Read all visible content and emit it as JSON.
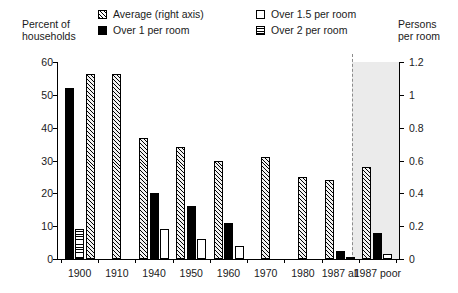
{
  "axis_captions": {
    "left_line1": "Percent of",
    "left_line2": "households",
    "right_line1": "Persons",
    "right_line2": "per room"
  },
  "legend": {
    "items": [
      {
        "label": "Average (right axis)",
        "icon": "hatch-swatch",
        "swatch": "hatch",
        "col": 1,
        "row": 1
      },
      {
        "label": "Over 1 per room",
        "icon": "solid-swatch",
        "swatch": "solid",
        "col": 1,
        "row": 2
      },
      {
        "label": "Over 1.5 per room",
        "icon": "white-swatch",
        "swatch": "white",
        "col": 2,
        "row": 1
      },
      {
        "label": "Over 2 per room",
        "icon": "hlines-swatch",
        "swatch": "hlines",
        "col": 2,
        "row": 2
      }
    ]
  },
  "chart_data": {
    "type": "bar",
    "title": "",
    "xlabel": "",
    "ylabel": "Percent of households",
    "y2label": "Persons per room",
    "ylim": [
      0,
      60
    ],
    "y2lim": [
      0,
      1.2
    ],
    "yticks": [
      "0",
      "10",
      "20",
      "30",
      "40",
      "50",
      "60"
    ],
    "ytick_values": [
      0,
      10,
      20,
      30,
      40,
      50,
      60
    ],
    "y2ticks": [
      "0",
      "0.2",
      "0.4",
      "0.6",
      "0.8",
      "1",
      "1.2"
    ],
    "y2tick_values": [
      0,
      0.2,
      0.4,
      0.6,
      0.8,
      1.0,
      1.2
    ],
    "grid": false,
    "legend_position": "top",
    "categories": [
      "1900",
      "1910",
      "1940",
      "1950",
      "1960",
      "1970",
      "1980",
      "1987 all",
      "1987 poor"
    ],
    "shaded_region": "1987 poor",
    "divider_after_category": "1987 all",
    "series": [
      {
        "name": "Average (right axis)",
        "axis": "right",
        "pattern": "hatch",
        "values": [
          1.13,
          1.13,
          0.74,
          0.68,
          0.6,
          0.62,
          0.5,
          0.48,
          0.56
        ]
      },
      {
        "name": "Over 1 per room",
        "axis": "left",
        "pattern": "solid",
        "values": [
          52,
          null,
          20,
          16,
          11,
          null,
          null,
          2.5,
          8
        ]
      },
      {
        "name": "Over 1.5 per room",
        "axis": "left",
        "pattern": "white",
        "values": [
          null,
          null,
          9,
          6,
          4,
          null,
          null,
          0.6,
          1.6
        ]
      },
      {
        "name": "Over 2 per room",
        "axis": "left",
        "pattern": "hlines",
        "values": [
          9,
          null,
          null,
          null,
          null,
          null,
          null,
          null,
          null
        ]
      }
    ]
  }
}
